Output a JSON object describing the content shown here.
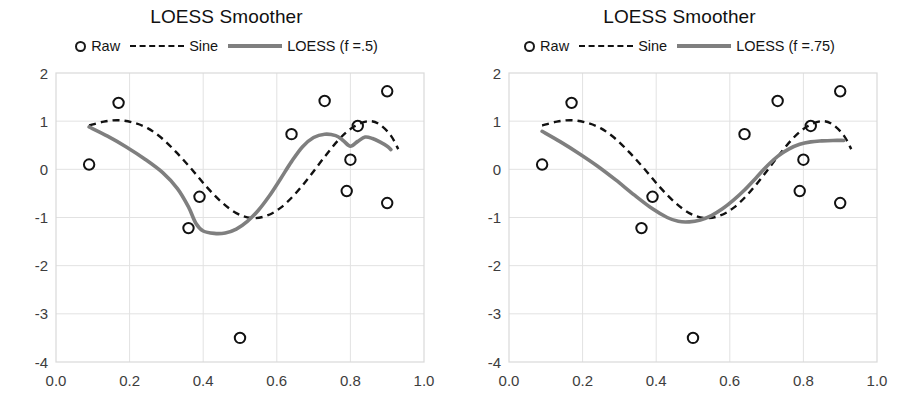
{
  "figure": {
    "width": 907,
    "height": 406,
    "background": "#ffffff",
    "panel_count": 2
  },
  "colors": {
    "raw_marker": "#111111",
    "sine_line": "#111111",
    "loess_line": "#7f7f7f",
    "grid": "#e2e2e2",
    "axis": "#d9d9d9",
    "text": "#1a1a1a"
  },
  "panels": [
    {
      "id": "left",
      "title": "LOESS Smoother",
      "legend": {
        "raw_label": "Raw",
        "sine_label": "Sine",
        "loess_label": "LOESS (f =.5)"
      }
    },
    {
      "id": "right",
      "title": "LOESS Smoother",
      "legend": {
        "raw_label": "Raw",
        "sine_label": "Sine",
        "loess_label": "LOESS (f =.75)"
      }
    }
  ],
  "chart_data": [
    {
      "type": "scatter",
      "panel": "left",
      "title": "LOESS Smoother",
      "xlabel": "",
      "ylabel": "",
      "xlim": [
        0.0,
        1.0
      ],
      "ylim": [
        -4,
        2
      ],
      "grid": true,
      "legend_position": "top-center",
      "xticks": [
        0.0,
        0.2,
        0.4,
        0.6,
        0.8,
        1.0
      ],
      "xtick_labels": [
        "0.0",
        "0.2",
        "0.4",
        "0.6",
        "0.8",
        "1.0"
      ],
      "yticks": [
        2,
        1,
        0,
        -1,
        -2,
        -3,
        -4
      ],
      "ytick_labels": [
        "2",
        "1",
        "0",
        "-1",
        "-2",
        "-3",
        "-4"
      ],
      "series": [
        {
          "name": "Raw",
          "type": "scatter",
          "marker": "open-circle",
          "points": [
            [
              0.09,
              0.1
            ],
            [
              0.17,
              1.38
            ],
            [
              0.36,
              -1.22
            ],
            [
              0.39,
              -0.57
            ],
            [
              0.5,
              -3.5
            ],
            [
              0.64,
              0.73
            ],
            [
              0.73,
              1.42
            ],
            [
              0.79,
              -0.45
            ],
            [
              0.8,
              0.2
            ],
            [
              0.82,
              0.9
            ],
            [
              0.9,
              1.62
            ],
            [
              0.9,
              -0.7
            ]
          ]
        },
        {
          "name": "Sine",
          "type": "line",
          "style": "dashed",
          "points": [
            [
              0.09,
              0.91
            ],
            [
              0.13,
              0.99
            ],
            [
              0.17,
              1.02
            ],
            [
              0.21,
              0.97
            ],
            [
              0.25,
              0.85
            ],
            [
              0.29,
              0.63
            ],
            [
              0.33,
              0.33
            ],
            [
              0.37,
              -0.01
            ],
            [
              0.41,
              -0.37
            ],
            [
              0.45,
              -0.68
            ],
            [
              0.49,
              -0.91
            ],
            [
              0.53,
              -1.01
            ],
            [
              0.57,
              -0.97
            ],
            [
              0.61,
              -0.8
            ],
            [
              0.65,
              -0.51
            ],
            [
              0.69,
              -0.14
            ],
            [
              0.73,
              0.26
            ],
            [
              0.77,
              0.63
            ],
            [
              0.81,
              0.89
            ],
            [
              0.85,
              1.0
            ],
            [
              0.88,
              0.93
            ],
            [
              0.91,
              0.7
            ],
            [
              0.93,
              0.42
            ]
          ]
        },
        {
          "name": "LOESS (f =.5)",
          "type": "line",
          "style": "solid",
          "points": [
            [
              0.09,
              0.88
            ],
            [
              0.14,
              0.69
            ],
            [
              0.19,
              0.47
            ],
            [
              0.24,
              0.22
            ],
            [
              0.29,
              -0.07
            ],
            [
              0.33,
              -0.4
            ],
            [
              0.36,
              -0.78
            ],
            [
              0.38,
              -1.12
            ],
            [
              0.4,
              -1.28
            ],
            [
              0.43,
              -1.33
            ],
            [
              0.46,
              -1.32
            ],
            [
              0.49,
              -1.24
            ],
            [
              0.52,
              -1.08
            ],
            [
              0.55,
              -0.85
            ],
            [
              0.58,
              -0.55
            ],
            [
              0.61,
              -0.2
            ],
            [
              0.64,
              0.16
            ],
            [
              0.67,
              0.47
            ],
            [
              0.7,
              0.66
            ],
            [
              0.73,
              0.73
            ],
            [
              0.76,
              0.7
            ],
            [
              0.78,
              0.6
            ],
            [
              0.8,
              0.48
            ],
            [
              0.82,
              0.58
            ],
            [
              0.84,
              0.67
            ],
            [
              0.86,
              0.64
            ],
            [
              0.88,
              0.57
            ],
            [
              0.9,
              0.48
            ],
            [
              0.91,
              0.41
            ]
          ]
        }
      ]
    },
    {
      "type": "scatter",
      "panel": "right",
      "title": "LOESS Smoother",
      "xlabel": "",
      "ylabel": "",
      "xlim": [
        0.0,
        1.0
      ],
      "ylim": [
        -4,
        2
      ],
      "grid": true,
      "legend_position": "top-center",
      "xticks": [
        0.0,
        0.2,
        0.4,
        0.6,
        0.8,
        1.0
      ],
      "xtick_labels": [
        "0.0",
        "0.2",
        "0.4",
        "0.6",
        "0.8",
        "1.0"
      ],
      "yticks": [
        2,
        1,
        0,
        -1,
        -2,
        -3,
        -4
      ],
      "ytick_labels": [
        "2",
        "1",
        "0",
        "-1",
        "-2",
        "-3",
        "-4"
      ],
      "series": [
        {
          "name": "Raw",
          "type": "scatter",
          "marker": "open-circle",
          "points": [
            [
              0.09,
              0.1
            ],
            [
              0.17,
              1.38
            ],
            [
              0.36,
              -1.22
            ],
            [
              0.39,
              -0.57
            ],
            [
              0.5,
              -3.5
            ],
            [
              0.64,
              0.73
            ],
            [
              0.73,
              1.42
            ],
            [
              0.79,
              -0.45
            ],
            [
              0.8,
              0.2
            ],
            [
              0.82,
              0.9
            ],
            [
              0.9,
              1.62
            ],
            [
              0.9,
              -0.7
            ]
          ]
        },
        {
          "name": "Sine",
          "type": "line",
          "style": "dashed",
          "points": [
            [
              0.09,
              0.91
            ],
            [
              0.13,
              0.99
            ],
            [
              0.17,
              1.02
            ],
            [
              0.21,
              0.97
            ],
            [
              0.25,
              0.85
            ],
            [
              0.29,
              0.63
            ],
            [
              0.33,
              0.33
            ],
            [
              0.37,
              -0.01
            ],
            [
              0.41,
              -0.37
            ],
            [
              0.45,
              -0.68
            ],
            [
              0.49,
              -0.91
            ],
            [
              0.53,
              -1.01
            ],
            [
              0.57,
              -0.97
            ],
            [
              0.61,
              -0.8
            ],
            [
              0.65,
              -0.51
            ],
            [
              0.69,
              -0.14
            ],
            [
              0.73,
              0.26
            ],
            [
              0.77,
              0.63
            ],
            [
              0.81,
              0.89
            ],
            [
              0.85,
              1.0
            ],
            [
              0.88,
              0.93
            ],
            [
              0.91,
              0.7
            ],
            [
              0.93,
              0.42
            ]
          ]
        },
        {
          "name": "LOESS (f =.75)",
          "type": "line",
          "style": "solid",
          "points": [
            [
              0.09,
              0.79
            ],
            [
              0.14,
              0.57
            ],
            [
              0.19,
              0.33
            ],
            [
              0.24,
              0.07
            ],
            [
              0.29,
              -0.22
            ],
            [
              0.34,
              -0.53
            ],
            [
              0.39,
              -0.82
            ],
            [
              0.43,
              -1.0
            ],
            [
              0.46,
              -1.08
            ],
            [
              0.49,
              -1.09
            ],
            [
              0.52,
              -1.05
            ],
            [
              0.55,
              -0.96
            ],
            [
              0.58,
              -0.82
            ],
            [
              0.61,
              -0.64
            ],
            [
              0.64,
              -0.43
            ],
            [
              0.67,
              -0.19
            ],
            [
              0.7,
              0.06
            ],
            [
              0.73,
              0.27
            ],
            [
              0.76,
              0.42
            ],
            [
              0.79,
              0.52
            ],
            [
              0.82,
              0.57
            ],
            [
              0.85,
              0.59
            ],
            [
              0.88,
              0.6
            ],
            [
              0.91,
              0.6
            ]
          ]
        }
      ]
    }
  ]
}
